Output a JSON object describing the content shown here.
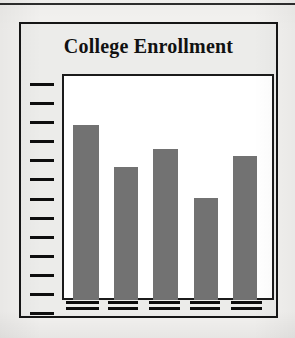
{
  "figure": {
    "title": "College Enrollment",
    "background_color": "#f3f2f0",
    "card_fill": "#ececea",
    "card_border_color": "#151515",
    "plot_fill": "#ffffff",
    "plot_border_color": "#1b1b1b",
    "bar_color": "#727272",
    "axis_color": "#0e0e0e",
    "top_rule_color": "#2e2e2e"
  },
  "chart_data": {
    "type": "bar",
    "title": "College Enrollment",
    "xlabel": "",
    "ylabel": "",
    "grid": false,
    "legend": null,
    "categories": [
      "",
      "",
      "",
      "",
      ""
    ],
    "category_labels_rendered": "illegible-placeholder-glyphs",
    "values": [
      79,
      60,
      68,
      46,
      65
    ],
    "ylim": [
      0,
      100
    ],
    "y_tick_count": 13,
    "y_tick_labels": [],
    "series": [
      {
        "name": "Enrollment",
        "color": "#727272",
        "values": [
          79,
          60,
          68,
          46,
          65
        ]
      }
    ]
  },
  "y_ticks": [
    {
      "index": 0
    },
    {
      "index": 1
    },
    {
      "index": 2
    },
    {
      "index": 3
    },
    {
      "index": 4
    },
    {
      "index": 5
    },
    {
      "index": 6
    },
    {
      "index": 7
    },
    {
      "index": 8
    },
    {
      "index": 9
    },
    {
      "index": 10
    },
    {
      "index": 11
    },
    {
      "index": 12
    }
  ],
  "bars": [
    {
      "id": "bar-1",
      "value": 79,
      "x_pct": 3.5,
      "width_pct": 12.5
    },
    {
      "id": "bar-2",
      "value": 60,
      "x_pct": 23.0,
      "width_pct": 11.5
    },
    {
      "id": "bar-3",
      "value": 68,
      "x_pct": 42.0,
      "width_pct": 12.0
    },
    {
      "id": "bar-4",
      "value": 46,
      "x_pct": 61.5,
      "width_pct": 11.5
    },
    {
      "id": "bar-5",
      "value": 65,
      "x_pct": 80.5,
      "width_pct": 11.5
    }
  ],
  "x_labels": [
    {
      "id": "x-label-1",
      "x_pct": 2.0,
      "width_pct": 15.5
    },
    {
      "id": "x-label-2",
      "x_pct": 21.5,
      "width_pct": 14.5
    },
    {
      "id": "x-label-3",
      "x_pct": 41.0,
      "width_pct": 14.5
    },
    {
      "id": "x-label-4",
      "x_pct": 60.5,
      "width_pct": 14.0
    },
    {
      "id": "x-label-5",
      "x_pct": 79.5,
      "width_pct": 15.0
    }
  ]
}
